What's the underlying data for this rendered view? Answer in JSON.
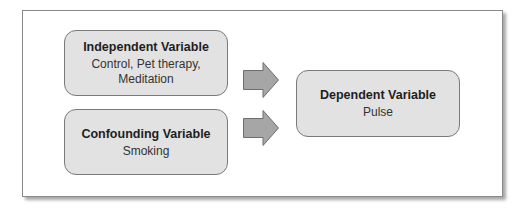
{
  "diagram": {
    "boxes": {
      "independent": {
        "title": "Independent Variable",
        "line1": "Control, Pet therapy,",
        "line2": "Meditation"
      },
      "confounding": {
        "title": "Confounding Variable",
        "line1": "Smoking"
      },
      "dependent": {
        "title": "Dependent Variable",
        "line1": "Pulse"
      }
    },
    "arrows": [
      {
        "from": "Independent Variable",
        "to": "Dependent Variable"
      },
      {
        "from": "Confounding Variable",
        "to": "Dependent Variable"
      }
    ],
    "colors": {
      "box_fill": "#e2e2e2",
      "box_border": "#7a7a7a",
      "arrow_fill": "#a6a6a6",
      "arrow_border": "#6e6e6e",
      "frame_border": "#8a8a8a"
    }
  }
}
